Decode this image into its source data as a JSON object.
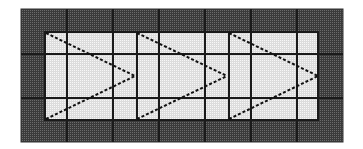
{
  "diagram": {
    "type": "grid-paper-drawing",
    "colors": {
      "page_background": "#ffffff",
      "outer_fill": "#6b6b6b",
      "outer_fine_grid": "#3a3a3a",
      "inner_fill": "#f7f7f7",
      "inner_fine_grid": "#dcdcdc",
      "major_grid_line": "#1a1a1a",
      "triangle_stroke": "#111111"
    },
    "outer_rect": {
      "x": 21,
      "y": 9,
      "width": 322,
      "height": 133
    },
    "inner_rect": {
      "x": 45,
      "y": 32,
      "width": 273,
      "height": 88
    },
    "major_vertical_lines_x": [
      67,
      113,
      159,
      205,
      251,
      297
    ],
    "major_horizontal_lines_y": [
      54,
      98
    ],
    "triangle_edge_lines_x": [
      45,
      137,
      229
    ],
    "triangles": [
      {
        "name": "triangle-1",
        "top": [
          46,
          33
        ],
        "tip": [
          135,
          76
        ],
        "bottom": [
          46,
          119
        ]
      },
      {
        "name": "triangle-2",
        "top": [
          137,
          33
        ],
        "tip": [
          227,
          76
        ],
        "bottom": [
          137,
          119
        ]
      },
      {
        "name": "triangle-3",
        "top": [
          229,
          33
        ],
        "tip": [
          318,
          76
        ],
        "bottom": [
          229,
          119
        ]
      }
    ]
  }
}
